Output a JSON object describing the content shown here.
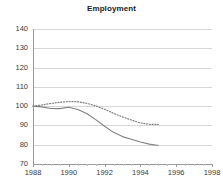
{
  "chart_data": {
    "type": "line",
    "title": "Employment",
    "xlabel": "",
    "ylabel": "",
    "xlim": [
      1988,
      1998
    ],
    "ylim": [
      70,
      140
    ],
    "ytick_labels": [
      "140",
      "130",
      "120",
      "110",
      "100",
      "90",
      "80",
      "70"
    ],
    "ytick_values": [
      140,
      130,
      120,
      110,
      100,
      90,
      80,
      70
    ],
    "xtick_labels": [
      "1988",
      "1990",
      "1992",
      "1994",
      "1996",
      "1998"
    ],
    "xtick_values": [
      1988,
      1990,
      1992,
      1994,
      1996,
      1998
    ],
    "grid": true,
    "legend": "none",
    "x": [
      1988,
      1988.5,
      1989,
      1989.5,
      1990,
      1990.5,
      1991,
      1991.5,
      1992,
      1992.5,
      1993,
      1993.5,
      1994,
      1994.5,
      1995
    ],
    "series": [
      {
        "name": "solid-series",
        "style": "solid",
        "color": "#808080",
        "values": [
          100.0,
          99.6,
          98.8,
          98.7,
          99.4,
          98.3,
          96.2,
          93.0,
          89.6,
          86.4,
          84.2,
          82.8,
          81.4,
          80.3,
          79.6
        ]
      },
      {
        "name": "dotted-series",
        "style": "dotted",
        "color": "#808080",
        "values": [
          100.0,
          100.6,
          101.4,
          102.0,
          102.4,
          102.3,
          101.5,
          100.2,
          98.4,
          96.3,
          94.4,
          92.8,
          91.3,
          90.6,
          90.5
        ]
      }
    ]
  }
}
